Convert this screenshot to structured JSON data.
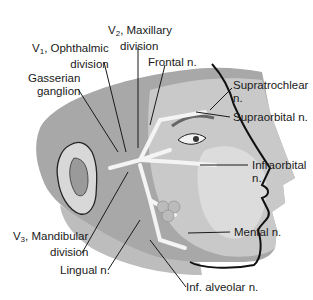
{
  "figure": {
    "colors": {
      "skin_dark": "#9a9a9a",
      "skin_mid": "#c4c4c4",
      "skin_light": "#e2e2e2",
      "nerve": "#f4f4f4",
      "outline": "#111111",
      "leader": "#1a1a1a"
    }
  },
  "labels": {
    "v2_prefix": "V",
    "v2_sub": "2",
    "v2_line1": ", Maxillary",
    "v2_line2": "division",
    "v1_prefix": "V",
    "v1_sub": "1",
    "v1_line1": ", Ophthalmic",
    "v1_line2": "division",
    "gasserian_line1": "Gasserian",
    "gasserian_line2": "ganglion",
    "frontal": "Frontal n.",
    "supratrochlear_line1": "Supratrochlear",
    "supratrochlear_line2": "n.",
    "supraorbital": "Supraorbital n.",
    "infraorbital_line1": "Infraorbital",
    "infraorbital_line2": "n.",
    "mental": "Mental n.",
    "v3_prefix": "V",
    "v3_sub": "3",
    "v3_line1": ", Mandibular",
    "v3_line2": "division",
    "lingual": "Lingual n.",
    "inf_alveolar": "Inf. alveolar n."
  }
}
